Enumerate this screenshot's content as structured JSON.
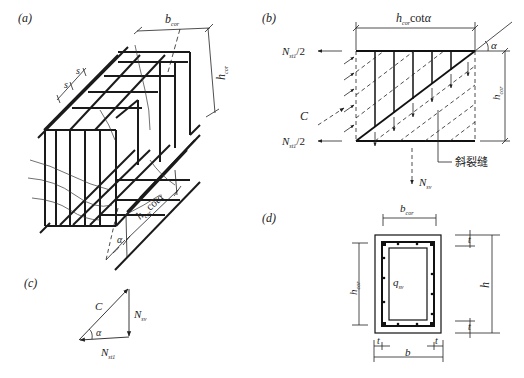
{
  "figure": {
    "panels": [
      {
        "id": "a",
        "label": "(a)",
        "description": "Space truss model of a reinforced concrete member under torsion",
        "dims": {
          "width": "b",
          "width_sub": "cor",
          "height": "h",
          "height_sub": "cor",
          "spacing": "s",
          "length_prefix": "h",
          "length_sub": "cor",
          "length_suffix": "cotα",
          "angle": "α"
        }
      },
      {
        "id": "b",
        "label": "(b)",
        "description": "Free-body of one face of the truss with inclined crack",
        "top_dim": {
          "prefix": "h",
          "sub": "cor",
          "suffix": "cotα"
        },
        "angle": "α",
        "height_dim": {
          "prefix": "h",
          "sub": "cor"
        },
        "forces": {
          "n_top": {
            "main": "N",
            "sub": "st1",
            "suffix": "/2"
          },
          "n_bottom": {
            "main": "N",
            "sub": "st1",
            "suffix": "/2"
          },
          "c": "C",
          "n_sv": {
            "main": "N",
            "sub": "sv"
          }
        },
        "crack_label": "斜裂缝"
      },
      {
        "id": "c",
        "label": "(c)",
        "description": "Force triangle",
        "forces": {
          "c": "C",
          "n_sv": {
            "main": "N",
            "sub": "sv"
          },
          "n_st1": {
            "main": "N",
            "sub": "st1"
          },
          "angle": "α"
        }
      },
      {
        "id": "d",
        "label": "(d)",
        "description": "Box cross section with shear flow",
        "dims": {
          "b_cor": {
            "main": "b",
            "sub": "cor"
          },
          "h_cor": {
            "main": "h",
            "sub": "cor"
          },
          "h": "h",
          "b": "b",
          "t": "t",
          "q_sv": {
            "main": "q",
            "sub": "sv"
          }
        }
      }
    ]
  }
}
